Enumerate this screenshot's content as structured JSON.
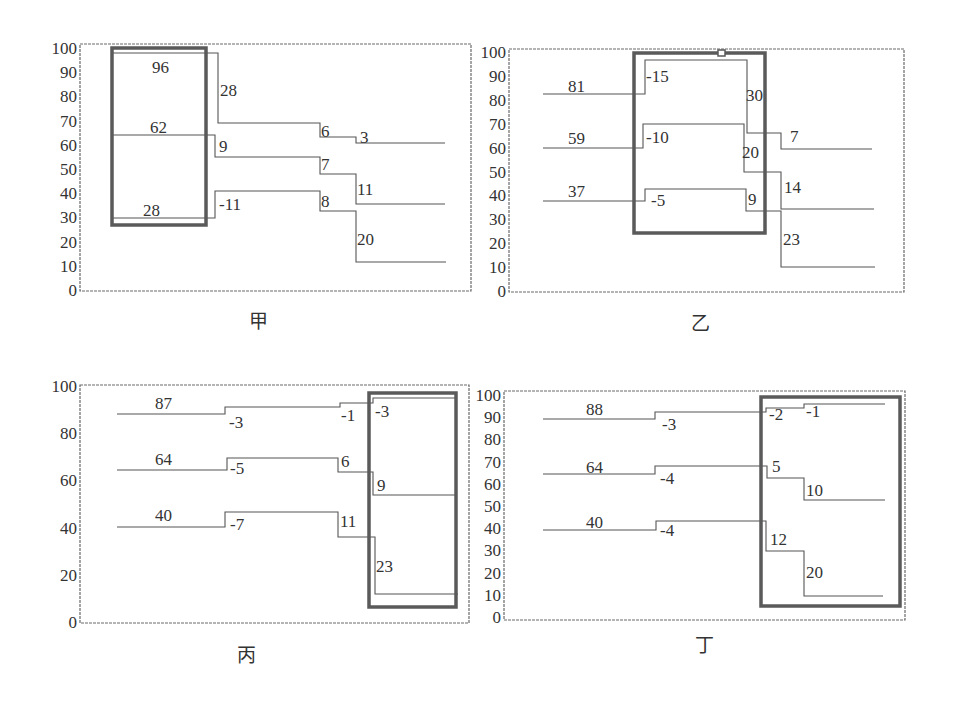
{
  "figure": {
    "colors": {
      "line": "#555555",
      "frame": "#6a6a6a",
      "highlight_box": "#5a5a5a",
      "text": "#333333"
    }
  },
  "chart_data": [
    {
      "type": "line",
      "title": "甲",
      "caption_pos": [
        258,
        328
      ],
      "frame": {
        "x1": 80,
        "y1": 44,
        "x2": 471,
        "y2": 291
      },
      "y_axis": {
        "ylim": [
          0,
          100
        ],
        "px_at_0": 290,
        "px_at_100": 48,
        "ticks": [
          0,
          10,
          20,
          30,
          40,
          50,
          60,
          70,
          80,
          90,
          100
        ]
      },
      "highlight_box": {
        "x1": 112,
        "y1": 48,
        "x2": 206,
        "y2": 225
      },
      "series": [
        {
          "name": "top",
          "start": 96,
          "changes": [
            -28,
            -6,
            -3
          ],
          "values": [
            96,
            68,
            62,
            59
          ],
          "points": [
            [
              112,
              53
            ],
            [
              218,
              53
            ],
            [
              218,
              123
            ],
            [
              320,
              123
            ],
            [
              320,
              137
            ],
            [
              356,
              137
            ],
            [
              356,
              143
            ],
            [
              445,
              143
            ]
          ]
        },
        {
          "name": "middle",
          "start": 62,
          "changes": [
            -9,
            -7,
            -11
          ],
          "values": [
            62,
            53,
            46,
            35
          ],
          "points": [
            [
              112,
              135
            ],
            [
              215,
              135
            ],
            [
              215,
              157
            ],
            [
              320,
              157
            ],
            [
              320,
              174
            ],
            [
              356,
              174
            ],
            [
              356,
              204
            ],
            [
              445,
              204
            ]
          ]
        },
        {
          "name": "bottom",
          "start": 28,
          "changes": [
            11,
            -8,
            -20
          ],
          "values": [
            28,
            39,
            31,
            11
          ],
          "points": [
            [
              112,
              218
            ],
            [
              215,
              218
            ],
            [
              215,
              191
            ],
            [
              320,
              191
            ],
            [
              320,
              211
            ],
            [
              356,
              211
            ],
            [
              356,
              262
            ],
            [
              446,
              262
            ]
          ]
        }
      ],
      "labels": [
        {
          "text": "96",
          "x": 152,
          "y": 73
        },
        {
          "text": "28",
          "x": 220,
          "y": 96
        },
        {
          "text": "6",
          "x": 321,
          "y": 137
        },
        {
          "text": "3",
          "x": 360,
          "y": 143
        },
        {
          "text": "62",
          "x": 150,
          "y": 133
        },
        {
          "text": "9",
          "x": 219,
          "y": 152
        },
        {
          "text": "7",
          "x": 321,
          "y": 170
        },
        {
          "text": "11",
          "x": 357,
          "y": 195
        },
        {
          "text": "28",
          "x": 143,
          "y": 216
        },
        {
          "text": "-11",
          "x": 219,
          "y": 210
        },
        {
          "text": "8",
          "x": 321,
          "y": 207
        },
        {
          "text": "20",
          "x": 357,
          "y": 245
        }
      ]
    },
    {
      "type": "line",
      "title": "乙",
      "caption_pos": [
        700,
        330
      ],
      "frame": {
        "x1": 509,
        "y1": 49,
        "x2": 904,
        "y2": 292
      },
      "y_axis": {
        "ylim": [
          0,
          100
        ],
        "px_at_0": 291,
        "px_at_100": 52,
        "ticks": [
          0,
          10,
          20,
          30,
          40,
          50,
          60,
          70,
          80,
          90,
          100
        ]
      },
      "highlight_box": {
        "x1": 634,
        "y1": 53,
        "x2": 765,
        "y2": 233
      },
      "marker": {
        "x": 718,
        "y": 50,
        "w": 7,
        "h": 6
      },
      "series": [
        {
          "name": "top",
          "start": 81,
          "changes": [
            -15,
            30,
            7
          ],
          "values": [
            81,
            96,
            66,
            59
          ],
          "points": [
            [
              543,
              94
            ],
            [
              645,
              94
            ],
            [
              645,
              60
            ],
            [
              747,
              60
            ],
            [
              747,
              133
            ],
            [
              781,
              133
            ],
            [
              781,
              149
            ],
            [
              872,
              149
            ]
          ]
        },
        {
          "name": "middle",
          "start": 59,
          "changes": [
            -10,
            20,
            14
          ],
          "values": [
            59,
            69,
            49,
            35
          ],
          "points": [
            [
              543,
              148
            ],
            [
              643,
              148
            ],
            [
              643,
              124
            ],
            [
              744,
              124
            ],
            [
              744,
              172
            ],
            [
              781,
              172
            ],
            [
              781,
              209
            ],
            [
              874,
              209
            ]
          ]
        },
        {
          "name": "bottom",
          "start": 37,
          "changes": [
            -5,
            9,
            23
          ],
          "values": [
            37,
            42,
            33,
            10
          ],
          "points": [
            [
              543,
              201
            ],
            [
              645,
              201
            ],
            [
              645,
              189
            ],
            [
              746,
              189
            ],
            [
              746,
              211
            ],
            [
              781,
              211
            ],
            [
              781,
              267
            ],
            [
              875,
              267
            ]
          ]
        }
      ],
      "labels": [
        {
          "text": "81",
          "x": 568,
          "y": 92
        },
        {
          "text": "-15",
          "x": 646,
          "y": 82
        },
        {
          "text": "30",
          "x": 746,
          "y": 101
        },
        {
          "text": "7",
          "x": 790,
          "y": 142
        },
        {
          "text": "59",
          "x": 568,
          "y": 144
        },
        {
          "text": "-10",
          "x": 646,
          "y": 143
        },
        {
          "text": "20",
          "x": 742,
          "y": 158
        },
        {
          "text": "14",
          "x": 784,
          "y": 193
        },
        {
          "text": "37",
          "x": 568,
          "y": 197
        },
        {
          "text": "-5",
          "x": 651,
          "y": 206
        },
        {
          "text": "9",
          "x": 748,
          "y": 205
        },
        {
          "text": "23",
          "x": 783,
          "y": 245
        }
      ]
    },
    {
      "type": "line",
      "title": "丙",
      "caption_pos": [
        246,
        662
      ],
      "frame": {
        "x1": 80,
        "y1": 385,
        "x2": 469,
        "y2": 623
      },
      "y_axis": {
        "ylim": [
          0,
          100
        ],
        "px_at_0": 622,
        "px_at_100": 386,
        "ticks": [
          0,
          20,
          40,
          60,
          80,
          100
        ]
      },
      "highlight_box": {
        "x1": 369,
        "y1": 393,
        "x2": 456,
        "y2": 607
      },
      "series": [
        {
          "name": "top",
          "start": 87,
          "changes": [
            -3,
            -1,
            -3
          ],
          "values": [
            87,
            90,
            91,
            94
          ],
          "points": [
            [
              117,
              414
            ],
            [
              225,
              414
            ],
            [
              225,
              407
            ],
            [
              340,
              407
            ],
            [
              340,
              403
            ],
            [
              373,
              403
            ],
            [
              373,
              398
            ],
            [
              456,
              398
            ]
          ]
        },
        {
          "name": "middle",
          "start": 64,
          "changes": [
            -5,
            6,
            9
          ],
          "values": [
            64,
            69,
            63,
            54
          ],
          "points": [
            [
              117,
              470
            ],
            [
              227,
              470
            ],
            [
              227,
              458
            ],
            [
              338,
              458
            ],
            [
              338,
              472
            ],
            [
              373,
              472
            ],
            [
              373,
              495
            ],
            [
              456,
              495
            ]
          ]
        },
        {
          "name": "bottom",
          "start": 40,
          "changes": [
            -7,
            11,
            23
          ],
          "values": [
            40,
            47,
            36,
            13
          ],
          "points": [
            [
              117,
              527
            ],
            [
              225,
              527
            ],
            [
              225,
              512
            ],
            [
              338,
              512
            ],
            [
              338,
              537
            ],
            [
              375,
              537
            ],
            [
              375,
              594
            ],
            [
              458,
              594
            ]
          ]
        }
      ],
      "labels": [
        {
          "text": "87",
          "x": 155,
          "y": 409
        },
        {
          "text": "-3",
          "x": 229,
          "y": 428
        },
        {
          "text": "-1",
          "x": 341,
          "y": 421
        },
        {
          "text": "-3",
          "x": 375,
          "y": 417
        },
        {
          "text": "64",
          "x": 155,
          "y": 465
        },
        {
          "text": "-5",
          "x": 230,
          "y": 474
        },
        {
          "text": "6",
          "x": 341,
          "y": 467
        },
        {
          "text": "9",
          "x": 377,
          "y": 491
        },
        {
          "text": "40",
          "x": 155,
          "y": 521
        },
        {
          "text": "-7",
          "x": 230,
          "y": 530
        },
        {
          "text": "11",
          "x": 340,
          "y": 527
        },
        {
          "text": "23",
          "x": 376,
          "y": 572
        }
      ]
    },
    {
      "type": "line",
      "title": "丁",
      "caption_pos": [
        704,
        652
      ],
      "frame": {
        "x1": 504,
        "y1": 391,
        "x2": 905,
        "y2": 620
      },
      "y_axis": {
        "ylim": [
          0,
          100
        ],
        "px_at_0": 617,
        "px_at_100": 395,
        "ticks": [
          0,
          10,
          20,
          30,
          40,
          50,
          60,
          70,
          80,
          90,
          100
        ]
      },
      "highlight_box": {
        "x1": 761,
        "y1": 397,
        "x2": 900,
        "y2": 606
      },
      "series": [
        {
          "name": "top",
          "start": 88,
          "changes": [
            -3,
            -2,
            -1
          ],
          "values": [
            88,
            91,
            93,
            94
          ],
          "points": [
            [
              543,
              419
            ],
            [
              655,
              419
            ],
            [
              655,
              412
            ],
            [
              766,
              412
            ],
            [
              766,
              408
            ],
            [
              804,
              408
            ],
            [
              804,
              404
            ],
            [
              885,
              404
            ]
          ]
        },
        {
          "name": "middle",
          "start": 64,
          "changes": [
            -4,
            5,
            10
          ],
          "values": [
            64,
            68,
            63,
            53
          ],
          "points": [
            [
              543,
              474
            ],
            [
              655,
              474
            ],
            [
              655,
              466
            ],
            [
              767,
              466
            ],
            [
              767,
              478
            ],
            [
              804,
              478
            ],
            [
              804,
              500
            ],
            [
              885,
              500
            ]
          ]
        },
        {
          "name": "bottom",
          "start": 40,
          "changes": [
            -4,
            12,
            20
          ],
          "values": [
            40,
            44,
            32,
            12
          ],
          "points": [
            [
              543,
              530
            ],
            [
              656,
              530
            ],
            [
              656,
              521
            ],
            [
              766,
              521
            ],
            [
              766,
              551
            ],
            [
              804,
              551
            ],
            [
              804,
              596
            ],
            [
              883,
              596
            ]
          ]
        }
      ],
      "labels": [
        {
          "text": "88",
          "x": 586,
          "y": 415
        },
        {
          "text": "-3",
          "x": 662,
          "y": 430
        },
        {
          "text": "-2",
          "x": 769,
          "y": 420
        },
        {
          "text": "-1",
          "x": 806,
          "y": 417
        },
        {
          "text": "64",
          "x": 586,
          "y": 473
        },
        {
          "text": "-4",
          "x": 660,
          "y": 484
        },
        {
          "text": "5",
          "x": 772,
          "y": 472
        },
        {
          "text": "10",
          "x": 806,
          "y": 496
        },
        {
          "text": "40",
          "x": 586,
          "y": 528
        },
        {
          "text": "-4",
          "x": 660,
          "y": 536
        },
        {
          "text": "12",
          "x": 770,
          "y": 545
        },
        {
          "text": "20",
          "x": 806,
          "y": 578
        }
      ]
    }
  ]
}
